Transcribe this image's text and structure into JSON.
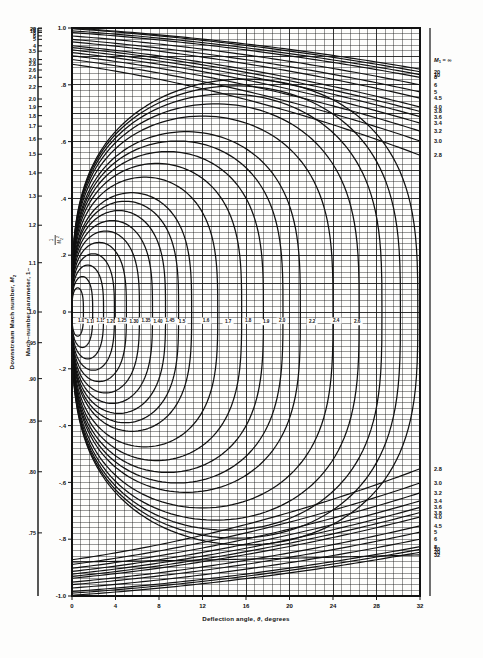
{
  "figure": {
    "background": "#fdfdfc",
    "ink": "#111111",
    "plot_box": {
      "left": 72,
      "top": 28,
      "right": 420,
      "bottom": 596
    }
  },
  "axes": {
    "left_outer": {
      "name": "Downstream Mach number, M2",
      "title": "Downstream Mach number,",
      "title_symbol": "M",
      "title_sub": "2",
      "ticks": [
        "∞",
        "20",
        "10",
        "8",
        "6",
        "5",
        "4",
        "3.5",
        "3.0",
        "2.8",
        "2.6",
        "2.4",
        "2.2",
        "2.0",
        "1.9",
        "1.8",
        "1.7",
        "1.6",
        "1.5",
        "1.4",
        "1.3",
        "1.2",
        "1.1",
        "1.0",
        ".95",
        ".90",
        ".85",
        ".80",
        ".75",
        ".70",
        ".65",
        ".60",
        ".55",
        ".50"
      ],
      "tick_values": [
        1.0,
        0.9975,
        0.99,
        0.984375,
        0.972222,
        0.96,
        0.9375,
        0.918367,
        0.888889,
        0.872449,
        0.852071,
        0.826389,
        0.793388,
        0.75,
        0.722992,
        0.691358,
        0.654412,
        0.609375,
        0.555556,
        0.489796,
        0.408284,
        0.305556,
        0.173554,
        0.0,
        -0.108033,
        -0.234568,
        -0.384083,
        -0.5625,
        -0.777778,
        -1.040816,
        -1.366864,
        -1.777778,
        -2.305785,
        -3.0
      ],
      "range": [
        -1.0,
        1.0
      ]
    },
    "left_inner": {
      "name": "Mach-number parameter",
      "title_prefix": "Mach–number parameter, 1–",
      "title_frac_num": "1",
      "title_frac_den": "M",
      "title_frac_den_sub": "2",
      "title_frac_den_sup": "2",
      "ticks": [
        "1.0",
        ".8",
        ".6",
        ".4",
        ".2",
        "0",
        "-.2",
        "-.4",
        "-.6",
        "-.8",
        "-1.0"
      ],
      "tick_values": [
        1.0,
        0.8,
        0.6,
        0.4,
        0.2,
        0.0,
        -0.2,
        -0.4,
        -0.6,
        -0.8,
        -1.0
      ],
      "range": [
        -1.0,
        1.0
      ],
      "minor_step": 0.02
    },
    "bottom": {
      "name": "Deflection angle theta degrees",
      "title_prefix": "Deflection  angle,",
      "title_symbol": "θ",
      "title_suffix": ", degrees",
      "ticks": [
        "0",
        "4",
        "8",
        "12",
        "16",
        "20",
        "24",
        "28",
        "32"
      ],
      "tick_values": [
        0,
        4,
        8,
        12,
        16,
        20,
        24,
        28,
        32
      ],
      "range": [
        0,
        32
      ],
      "minor_step": 0.8
    },
    "right": {
      "name": "Upstream Mach number M1",
      "header_symbol": "M",
      "header_sub": "1",
      "header_eq": "= ∞",
      "labels_upper": [
        "20",
        "10",
        "8",
        "6",
        "5",
        "4.5",
        "4.0",
        "3.8",
        "3.6",
        "3.4",
        "3.2",
        "3.0",
        "2.8"
      ],
      "labels_lower": [
        "2.8",
        "3.0",
        "3.2",
        "3.4",
        "3.6",
        "3.8",
        "4.0",
        "4.5",
        "5",
        "6",
        "8",
        "10",
        "20",
        "32"
      ]
    }
  },
  "chart_data": {
    "type": "line",
    "title": "",
    "xlabel": "Deflection angle, θ, degrees",
    "ylabel": "Mach-number parameter, 1 - 1/M₂²",
    "xlim": [
      0,
      32
    ],
    "ylim": [
      -1.0,
      1.0
    ],
    "grid": true,
    "legend": "right-axis labels",
    "contour_labels_center": [
      "1.05",
      "1.10",
      "1.15",
      "1.20",
      "1.25",
      "1.30",
      "1.35",
      "1.40",
      "1.45",
      "1.5",
      "1.6",
      "1.7",
      "1.8",
      "1.9",
      "2.0",
      "2.2",
      "2.4",
      "2.6"
    ],
    "ovals": [
      {
        "m1": "1.05",
        "theta_max": 1.05,
        "x_center": 0.45,
        "y_half": 0.085
      },
      {
        "m1": "1.10",
        "theta_max": 1.9,
        "x_center": 0.8,
        "y_half": 0.125
      },
      {
        "m1": "1.15",
        "theta_max": 2.9,
        "x_center": 1.2,
        "y_half": 0.165
      },
      {
        "m1": "1.20",
        "theta_max": 3.9,
        "x_center": 1.65,
        "y_half": 0.205
      },
      {
        "m1": "1.25",
        "theta_max": 5.0,
        "x_center": 2.1,
        "y_half": 0.245
      },
      {
        "m1": "1.30",
        "theta_max": 6.2,
        "x_center": 2.6,
        "y_half": 0.285
      },
      {
        "m1": "1.35",
        "theta_max": 7.4,
        "x_center": 3.1,
        "y_half": 0.322
      },
      {
        "m1": "1.40",
        "theta_max": 8.6,
        "x_center": 3.6,
        "y_half": 0.357
      },
      {
        "m1": "1.45",
        "theta_max": 9.8,
        "x_center": 4.1,
        "y_half": 0.39
      },
      {
        "m1": "1.5",
        "theta_max": 11.0,
        "x_center": 4.6,
        "y_half": 0.42
      },
      {
        "m1": "1.6",
        "theta_max": 13.4,
        "x_center": 5.7,
        "y_half": 0.475
      },
      {
        "m1": "1.7",
        "theta_max": 15.6,
        "x_center": 6.8,
        "y_half": 0.523
      },
      {
        "m1": "1.8",
        "theta_max": 17.6,
        "x_center": 7.9,
        "y_half": 0.565
      },
      {
        "m1": "1.9",
        "theta_max": 19.4,
        "x_center": 9.0,
        "y_half": 0.602
      },
      {
        "m1": "2.0",
        "theta_max": 21.0,
        "x_center": 10.0,
        "y_half": 0.635
      },
      {
        "m1": "2.2",
        "theta_max": 24.0,
        "x_center": 12.0,
        "y_half": 0.69
      },
      {
        "m1": "2.4",
        "theta_max": 26.4,
        "x_center": 13.8,
        "y_half": 0.733
      },
      {
        "m1": "2.6",
        "theta_max": 28.5,
        "x_center": 15.5,
        "y_half": 0.768
      },
      {
        "m1": "2.8",
        "theta_max": 30.2,
        "x_center": 17.0,
        "y_half": 0.796
      },
      {
        "m1": "3.0",
        "theta_max": 31.8,
        "x_center": 18.4,
        "y_half": 0.82
      }
    ],
    "upper_branches": [
      {
        "m1": "∞",
        "y0": 1.0,
        "y32": 0.855
      },
      {
        "m1": "20",
        "y0": 0.9975,
        "y32": 0.846
      },
      {
        "m1": "10",
        "y0": 0.99,
        "y32": 0.836
      },
      {
        "m1": "8",
        "y0": 0.984,
        "y32": 0.826
      },
      {
        "m1": "6",
        "y0": 0.972,
        "y32": 0.8
      },
      {
        "m1": "5",
        "y0": 0.96,
        "y32": 0.775
      },
      {
        "m1": "4.5",
        "y0": 0.951,
        "y32": 0.753
      },
      {
        "m1": "4.0",
        "y0": 0.9375,
        "y32": 0.722
      },
      {
        "m1": "3.8",
        "y0": 0.931,
        "y32": 0.706
      },
      {
        "m1": "3.6",
        "y0": 0.9228,
        "y32": 0.688
      },
      {
        "m1": "3.4",
        "y0": 0.9135,
        "y32": 0.665
      },
      {
        "m1": "3.2",
        "y0": 0.9023,
        "y32": 0.637
      },
      {
        "m1": "3.0",
        "y0": 0.8889,
        "y32": 0.602
      },
      {
        "m1": "2.8",
        "y0": 0.8724,
        "y32": 0.552
      }
    ],
    "lower_branches": [
      {
        "m1": "2.8",
        "y32": -0.552
      },
      {
        "m1": "3.0",
        "y32": -0.602
      },
      {
        "m1": "3.2",
        "y32": -0.637
      },
      {
        "m1": "3.4",
        "y32": -0.665
      },
      {
        "m1": "3.6",
        "y32": -0.688
      },
      {
        "m1": "3.8",
        "y32": -0.706
      },
      {
        "m1": "4.0",
        "y32": -0.722
      },
      {
        "m1": "4.5",
        "y32": -0.753
      },
      {
        "m1": "5",
        "y32": -0.775
      },
      {
        "m1": "6",
        "y32": -0.8
      },
      {
        "m1": "8",
        "y32": -0.826
      },
      {
        "m1": "10",
        "y32": -0.836
      },
      {
        "m1": "20",
        "y32": -0.846
      },
      {
        "m1": "32",
        "y32": -0.855
      }
    ]
  }
}
